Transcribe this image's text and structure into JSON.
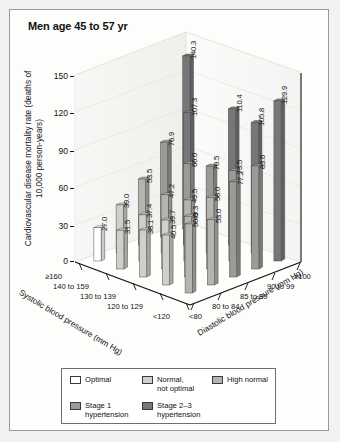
{
  "title": "Men age 45 to 57 yr",
  "chart_data": {
    "type": "bar",
    "title": "Men age 45 to 57 yr",
    "subtitle": "",
    "xlabel": "Systolic blood pressure (mm Hg)",
    "zlabel": "Diastolic blood pressure (mm Hg)",
    "ylabel": "Cardiovascular disease mortality rate (deaths of 10,000 person-years)",
    "ylim": [
      0,
      150
    ],
    "yticks": [
      "0",
      "30",
      "60",
      "90",
      "120",
      "150"
    ],
    "grid": true,
    "legend_position": "bottom",
    "systolic_categories": [
      "≥160",
      "140 to 159",
      "130 to 139",
      "120 to 129",
      "<120"
    ],
    "diastolic_categories": [
      "<80",
      "80 to 84",
      "85 to 89",
      "90 to 99",
      "≥100"
    ],
    "series": [
      {
        "name": "≥160",
        "values": [
          140.3,
          null,
          null,
          null,
          129.9
        ]
      },
      {
        "name": "140 to 159",
        "values": [
          76.9,
          107.3,
          null,
          83.6,
          null
        ]
      },
      {
        "name": "130 to 139",
        "values": [
          53.5,
          66.0,
          73.5,
          77.2,
          null
        ]
      },
      {
        "name": "120 to 129",
        "values": [
          39.0,
          47.2,
          49.5,
          58.0,
          53.0
        ]
      },
      {
        "name": "<120",
        "values": [
          27.0,
          37.4,
          39.7,
          49.3,
          56.0
        ]
      }
    ],
    "bars": [
      {
        "value": 140.3,
        "label": "140.3",
        "sys": "≥160",
        "dia": "<80",
        "category": "Stage 2–3 hypertension"
      },
      {
        "value": 107.3,
        "label": "107.3",
        "sys": "140 to 159",
        "dia": "80 to 84",
        "category": "Stage 2–3 hypertension"
      },
      {
        "value": 110.4,
        "label": "110.4",
        "sys": "≥160",
        "dia": "85 to 89",
        "category": "Stage 2–3 hypertension"
      },
      {
        "value": 105.8,
        "label": "105.8",
        "sys": "≥160",
        "dia": "90 to 99",
        "category": "Stage 2–3 hypertension"
      },
      {
        "value": 129.9,
        "label": "129.9",
        "sys": "≥160",
        "dia": "≥100",
        "category": "Stage 2–3 hypertension"
      },
      {
        "value": 76.9,
        "label": "76.9",
        "sys": "140 to 159",
        "dia": "<80",
        "category": "Stage 1 hypertension"
      },
      {
        "value": 66.0,
        "label": "66.0",
        "sys": "140 to 159",
        "dia": "80 to 84",
        "category": "Stage 1 hypertension"
      },
      {
        "value": 70.5,
        "label": "70.5",
        "sys": "140 to 159",
        "dia": "85 to 89",
        "category": "Stage 1 hypertension"
      },
      {
        "value": 73.5,
        "label": "73.5",
        "sys": "140 to 159",
        "dia": "90 to 99",
        "category": "Stage 1 hypertension"
      },
      {
        "value": 83.6,
        "label": "83.6",
        "sys": "140 to 159",
        "dia": "≥100",
        "category": "Stage 1 hypertension"
      },
      {
        "value": 77.2,
        "label": "77.2",
        "sys": "130 to 139",
        "dia": "≥100",
        "category": "Stage 1 hypertension"
      },
      {
        "value": 53.5,
        "label": "53.5",
        "sys": "130 to 139",
        "dia": "<80",
        "category": "High normal"
      },
      {
        "value": 47.2,
        "label": "47.2",
        "sys": "130 to 139",
        "dia": "80 to 84",
        "category": "High normal"
      },
      {
        "value": 49.5,
        "label": "49.5",
        "sys": "130 to 139",
        "dia": "85 to 89",
        "category": "High normal"
      },
      {
        "value": 58.0,
        "label": "58.0",
        "sys": "130 to 139",
        "dia": "90 to 99",
        "category": "High normal"
      },
      {
        "value": 49.3,
        "label": "49.3",
        "sys": "120 to 129",
        "dia": "90 to 99",
        "category": "High normal"
      },
      {
        "value": 53.0,
        "label": "53.0",
        "sys": "120 to 129",
        "dia": "≥100",
        "category": "High normal"
      },
      {
        "value": 56.0,
        "label": "56.0",
        "sys": "<120",
        "dia": "≥100",
        "category": "High normal"
      },
      {
        "value": 39.0,
        "label": "39.0",
        "sys": "120 to 129",
        "dia": "<80",
        "category": "Normal, not optimal"
      },
      {
        "value": 37.4,
        "label": "37.4",
        "sys": "120 to 129",
        "dia": "80 to 84",
        "category": "Normal, not optimal"
      },
      {
        "value": 39.7,
        "label": "39.7",
        "sys": "120 to 129",
        "dia": "85 to 89",
        "category": "Normal, not optimal"
      },
      {
        "value": 31.5,
        "label": "31.5",
        "sys": "<120",
        "dia": "80 to 84",
        "category": "Normal, not optimal"
      },
      {
        "value": 38.1,
        "label": "38.1",
        "sys": "<120",
        "dia": "85 to 89",
        "category": "Normal, not optimal"
      },
      {
        "value": 40.5,
        "label": "40.5",
        "sys": "<120",
        "dia": "90 to 99",
        "category": "Normal, not optimal"
      },
      {
        "value": 27.0,
        "label": "27.0",
        "sys": "<120",
        "dia": "<80",
        "category": "Optimal"
      }
    ]
  },
  "legend": {
    "items": [
      {
        "label": "Optimal",
        "color": "#ffffff"
      },
      {
        "label": "Normal,\nnot optimal",
        "color": "#cfcfcc"
      },
      {
        "label": "High normal",
        "color": "#b4b4b0"
      },
      {
        "label": "Stage 1\nhypertension",
        "color": "#9a9a96"
      },
      {
        "label": "Stage 2–3\nhypertension",
        "color": "#77777a"
      }
    ],
    "row1": [
      "Optimal",
      "Normal,",
      "High normal"
    ],
    "row1_sub": "not optimal",
    "row2": [
      "Stage 1",
      "Stage 2–3"
    ],
    "row2_sub": "hypertension"
  },
  "colors": {
    "optimal": "#ffffff",
    "normal_not_optimal": "#cfcfcc",
    "high_normal": "#b4b4b0",
    "stage1": "#9a9a96",
    "stage23": "#77777a",
    "axis": "#111111",
    "panel": "#fdfdfc"
  }
}
